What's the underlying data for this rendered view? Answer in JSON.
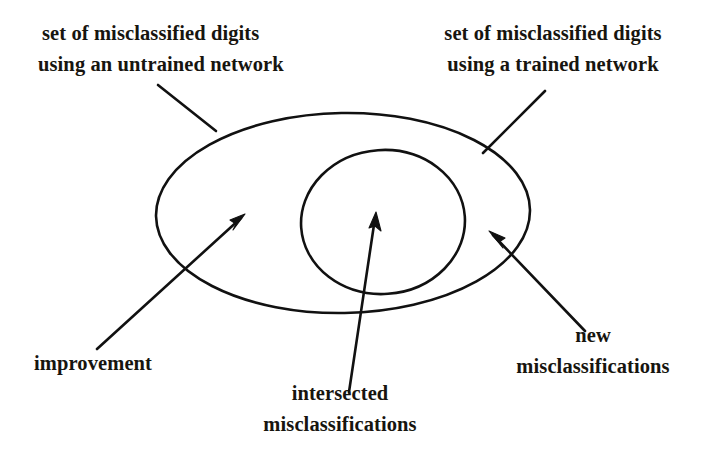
{
  "figure": {
    "kind": "venn-diagram",
    "background_color": "#ffffff",
    "stroke_color": "#111111"
  },
  "labels": {
    "untrained_set": {
      "line1": "set of misclassified digits",
      "line2": "using an untrained network"
    },
    "trained_set": {
      "line1": "set of misclassified digits",
      "line2": "using a trained network"
    },
    "improvement": {
      "line1": "improvement"
    },
    "intersected": {
      "line1": "intersected",
      "line2": "misclassifications"
    },
    "new_misclassifications": {
      "line1": "new",
      "line2": "misclassifications"
    }
  },
  "shapes": {
    "large_ellipse": {
      "name": "untrained-network-set",
      "cx": 343,
      "cy": 213,
      "rx": 187,
      "ry": 100
    },
    "small_ellipse": {
      "name": "trained-network-set",
      "cx": 383,
      "cy": 222,
      "rx": 82,
      "ry": 72
    }
  },
  "connectors": {
    "untrained_leader": {
      "x1": 158,
      "y1": 85,
      "x2": 216,
      "y2": 131
    },
    "trained_leader": {
      "x1": 545,
      "y1": 91,
      "x2": 483,
      "y2": 153
    },
    "improvement_arrow": {
      "x1": 97,
      "y1": 349,
      "x2": 245,
      "y2": 214
    },
    "intersected_arrow": {
      "x1": 349,
      "y1": 392,
      "x2": 376,
      "y2": 212
    },
    "new_arrow": {
      "x1": 585,
      "y1": 331,
      "x2": 489,
      "y2": 231
    }
  }
}
